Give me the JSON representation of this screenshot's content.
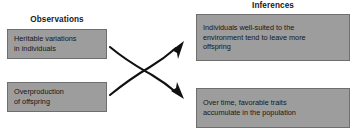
{
  "diagram": {
    "type": "flow-diagram",
    "background_color": "#ffffff",
    "box_fill_color": "#9d9d9d",
    "box_border_color": "#6f6f6f",
    "text_color": "#161616",
    "arrow_color": "#111111",
    "columns": [
      {
        "id": "observations",
        "header": "Observations"
      },
      {
        "id": "inferences",
        "header": "Inferences"
      }
    ],
    "nodes": [
      {
        "id": "heritable",
        "column": "observations",
        "text": "Heritable variations\nin individuals"
      },
      {
        "id": "overproduction",
        "column": "observations",
        "text": "Overproduction\nof offspring"
      },
      {
        "id": "wellsuited",
        "column": "inferences",
        "text": "Individuals well-suited to the\nenvironment tend to leave more\noffspring"
      },
      {
        "id": "favorable",
        "column": "inferences",
        "text": "Over time, favorable traits\naccumulate in the population"
      }
    ],
    "edges": [
      {
        "id": "heritable-to-favorable",
        "from": "heritable",
        "to": "favorable",
        "style": "curved-arrow",
        "direction": "down-right"
      },
      {
        "id": "overproduction-to-wellsuited",
        "from": "overproduction",
        "to": "wellsuited",
        "style": "curved-arrow",
        "direction": "up-right"
      }
    ]
  }
}
